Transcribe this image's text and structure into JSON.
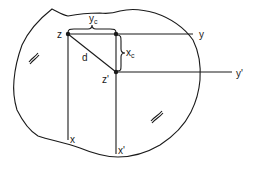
{
  "figure": {
    "colors": {
      "ink": "#1a1a1a",
      "background": "#ffffff"
    },
    "points": {
      "z": {
        "label": "z",
        "x": 68,
        "y": 34
      },
      "z_prime": {
        "label": "z'",
        "x": 116,
        "y": 72
      },
      "corner": {
        "x": 116,
        "y": 34
      }
    },
    "axes": {
      "x": {
        "label": "x"
      },
      "y": {
        "label": "y"
      },
      "x_prime": {
        "label": "x'"
      },
      "y_prime": {
        "label": "y'"
      }
    },
    "dimensions": {
      "yc": {
        "main": "y",
        "sub": "c"
      },
      "xc": {
        "main": "x",
        "sub": "c"
      },
      "d": {
        "label": "d"
      }
    }
  }
}
